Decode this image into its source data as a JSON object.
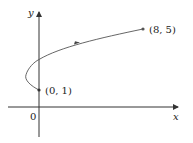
{
  "diagram": {
    "type": "parametric-curve",
    "axes": {
      "x_label": "x",
      "y_label": "y",
      "origin_label": "0"
    },
    "points": [
      {
        "label": "(0, 1)",
        "x": 0,
        "y": 1
      },
      {
        "label": "(8, 5)",
        "x": 8,
        "y": 5
      }
    ],
    "curve": {
      "description": "x = t^2 - 2t, y = t + 1, 0 <= t <= 4",
      "start": [
        0,
        1
      ],
      "end": [
        8,
        5
      ],
      "leftmost": [
        -1,
        2
      ],
      "y_axis_crossing": [
        0,
        3
      ],
      "direction_arrow": "toward (8, 5)"
    },
    "colors": {
      "axis": "#333333",
      "curve": "#555555",
      "text": "#222222"
    }
  }
}
